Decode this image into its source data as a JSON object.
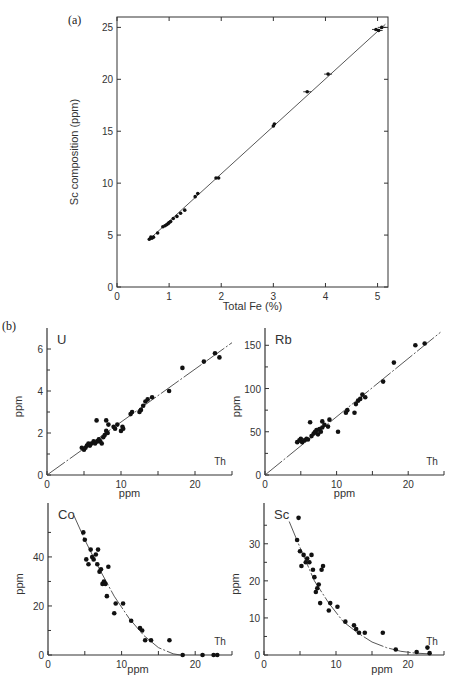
{
  "figure": {
    "panel_a_label": "(a)",
    "panel_b_label": "(b)"
  },
  "chart_data": [
    {
      "id": "a",
      "type": "scatter",
      "title": "",
      "xlabel": "Total Fe (%)",
      "ylabel": "Sc composition (ppm)",
      "xlim": [
        0,
        5.2
      ],
      "ylim": [
        0,
        26
      ],
      "xticks": [
        "0",
        "1",
        "2",
        "3",
        "4",
        "5"
      ],
      "yticks": [
        "0",
        "5",
        "10",
        "15",
        "20",
        "25"
      ],
      "fit_line": {
        "x": [
          0.6,
          5.15
        ],
        "y": [
          4.5,
          25.3
        ]
      },
      "x": [
        0.62,
        0.65,
        0.67,
        0.7,
        0.78,
        0.88,
        0.92,
        0.95,
        0.98,
        1.0,
        1.03,
        1.08,
        1.15,
        1.22,
        1.3,
        1.5,
        1.55,
        1.9,
        1.95,
        3.0,
        3.02,
        3.65,
        4.05,
        4.97,
        5.02,
        5.08
      ],
      "y": [
        4.6,
        4.8,
        4.7,
        4.8,
        5.2,
        5.8,
        5.9,
        6.0,
        6.1,
        6.2,
        6.3,
        6.6,
        6.8,
        7.1,
        7.4,
        8.7,
        9.0,
        10.5,
        10.5,
        15.5,
        15.7,
        18.8,
        20.5,
        24.8,
        24.7,
        25.0
      ]
    },
    {
      "id": "b-U",
      "type": "scatter",
      "title": "U",
      "xlabel": "ppm",
      "ylabel": "ppm",
      "corner_label": "Th",
      "xlim": [
        0,
        25
      ],
      "ylim": [
        0,
        7
      ],
      "xticks": [
        "0",
        "10",
        "20"
      ],
      "yticks": [
        "0",
        "2",
        "4",
        "6"
      ],
      "fit_line": {
        "x": [
          0,
          25
        ],
        "y": [
          0,
          6.3
        ]
      },
      "x": [
        4.7,
        5.0,
        5.2,
        5.4,
        5.6,
        5.8,
        6.0,
        6.3,
        6.5,
        6.7,
        6.8,
        7.0,
        7.2,
        7.4,
        7.6,
        7.8,
        8.0,
        8.2,
        8.0,
        8.3,
        9.0,
        9.2,
        9.5,
        10.0,
        10.2,
        10.3,
        11.3,
        11.5,
        12.5,
        12.7,
        13.0,
        13.3,
        13.6,
        14.2,
        16.5,
        18.3,
        21.2,
        22.7,
        23.3
      ],
      "y": [
        1.3,
        1.2,
        1.3,
        1.4,
        1.5,
        1.4,
        1.5,
        1.6,
        1.5,
        2.6,
        1.6,
        1.7,
        1.6,
        1.5,
        1.8,
        1.9,
        2.1,
        2.0,
        2.6,
        2.4,
        2.3,
        2.2,
        2.4,
        2.1,
        2.3,
        2.2,
        2.9,
        3.0,
        3.0,
        3.1,
        3.3,
        3.5,
        3.6,
        3.7,
        4.0,
        5.1,
        5.4,
        5.8,
        5.6
      ]
    },
    {
      "id": "b-Rb",
      "type": "scatter",
      "title": "Rb",
      "xlabel": "ppm",
      "ylabel": "ppm",
      "corner_label": "Th",
      "xlim": [
        0,
        25
      ],
      "ylim": [
        0,
        170
      ],
      "xticks": [
        "0",
        "10",
        "20"
      ],
      "yticks": [
        "0",
        "50",
        "100",
        "150"
      ],
      "fit_line": {
        "x": [
          0,
          24.5
        ],
        "y": [
          0,
          165
        ]
      },
      "x": [
        4.5,
        4.8,
        5.0,
        5.2,
        5.5,
        5.8,
        6.0,
        6.3,
        6.5,
        6.8,
        7.0,
        7.2,
        7.4,
        7.6,
        7.8,
        8.0,
        8.0,
        8.3,
        8.8,
        9.0,
        10.2,
        11.3,
        11.5,
        12.5,
        12.7,
        13.0,
        13.3,
        13.6,
        14.0,
        16.5,
        18.0,
        21.0,
        22.3
      ],
      "y": [
        38,
        40,
        42,
        38,
        40,
        42,
        41,
        61,
        45,
        48,
        50,
        52,
        47,
        53,
        50,
        55,
        62,
        58,
        56,
        64,
        50,
        72,
        75,
        72,
        82,
        86,
        88,
        93,
        90,
        108,
        130,
        150,
        152
      ]
    },
    {
      "id": "b-Co",
      "type": "scatter",
      "title": "Co",
      "xlabel": "ppm",
      "ylabel": "ppm",
      "corner_label": "Th",
      "xlim": [
        0,
        25
      ],
      "ylim": [
        0,
        62
      ],
      "xticks": [
        "0",
        "10",
        "20"
      ],
      "yticks": [
        "0",
        "20",
        "40"
      ],
      "fit_curve": {
        "x": [
          3.5,
          5,
          7,
          9,
          11,
          13,
          15,
          17,
          18
        ],
        "y": [
          57,
          47,
          35,
          24,
          15,
          8,
          3,
          0.5,
          0
        ]
      },
      "x": [
        4.8,
        5.0,
        5.2,
        5.5,
        5.8,
        6.0,
        6.2,
        6.5,
        6.7,
        6.8,
        7.0,
        7.2,
        7.4,
        7.6,
        7.8,
        8.0,
        8.2,
        9.0,
        9.2,
        10.2,
        11.3,
        12.5,
        12.8,
        13.2,
        14.0,
        16.5,
        18.3,
        21.0,
        22.5,
        23.0
      ],
      "y": [
        50,
        47,
        39,
        37,
        43,
        40,
        39,
        41,
        37,
        43,
        34,
        35,
        29,
        30,
        29,
        24,
        36,
        17,
        21,
        21,
        14,
        11,
        10,
        6,
        6,
        6,
        0,
        0,
        0,
        0
      ]
    },
    {
      "id": "b-Sc",
      "type": "scatter",
      "title": "Sc",
      "xlabel": "ppm",
      "ylabel": "ppm",
      "corner_label": "Th",
      "xlim": [
        0,
        25
      ],
      "ylim": [
        0,
        41
      ],
      "xticks": [
        "0",
        "10",
        "20"
      ],
      "yticks": [
        "0",
        "10",
        "20",
        "30"
      ],
      "fit_curve": {
        "x": [
          3.5,
          5,
          7,
          9,
          11,
          13,
          15,
          17,
          19,
          21,
          23
        ],
        "y": [
          36,
          29,
          20,
          14,
          9,
          6,
          3.5,
          2,
          1,
          0.5,
          0.3
        ]
      },
      "x": [
        4.6,
        4.8,
        5.0,
        5.2,
        5.5,
        5.8,
        6.0,
        6.3,
        6.6,
        6.8,
        7.0,
        7.2,
        7.4,
        7.6,
        7.8,
        8.0,
        8.2,
        9.0,
        9.2,
        10.2,
        11.3,
        12.5,
        12.8,
        13.2,
        14.0,
        16.5,
        18.3,
        21.2,
        22.7,
        23.0
      ],
      "y": [
        31,
        37,
        28,
        24,
        27,
        25,
        26,
        25,
        27,
        23,
        21,
        17,
        18,
        19,
        14,
        23,
        24,
        12,
        14,
        13,
        9,
        8,
        7,
        6,
        6,
        6,
        1.5,
        0.8,
        2,
        0.5
      ]
    }
  ]
}
